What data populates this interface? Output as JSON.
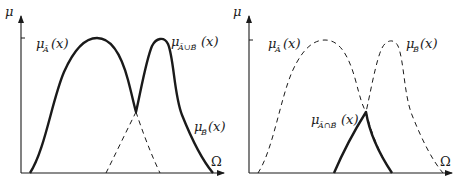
{
  "figure": {
    "colors": {
      "ink": "#1a1a1a",
      "background": "#ffffff"
    },
    "left_panel": {
      "title": "Union of fuzzy sets",
      "y_axis_label": "μ",
      "x_axis_label": "Ω",
      "curve_a_label": {
        "mu": "μ",
        "sub": "Ã",
        "arg": "(x)"
      },
      "union_label": {
        "mu": "μ",
        "sub": "Ã∪B̃",
        "arg": "(x)"
      },
      "curve_b_label": {
        "mu": "μ",
        "sub": "B̃",
        "arg": "(x)"
      }
    },
    "right_panel": {
      "title": "Intersection of fuzzy sets",
      "y_axis_label": "μ",
      "x_axis_label": "Ω",
      "curve_a_label": {
        "mu": "μ",
        "sub": "Ã",
        "arg": "(x)"
      },
      "curve_b_label": {
        "mu": "μ",
        "sub": "B̃",
        "arg": "(x)"
      },
      "intersection_label": {
        "mu": "μ",
        "sub": "Ã∩B̃",
        "arg": "(x)"
      }
    }
  }
}
